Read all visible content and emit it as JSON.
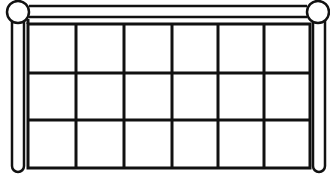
{
  "figure": {
    "stroke_color": "#111111",
    "background": "#ffffff",
    "grid": {
      "columns": 6,
      "rows": 3,
      "x_lines": [
        28,
        76,
        124,
        172,
        218,
        264,
        310
      ],
      "y_lines": [
        24,
        73,
        120,
        168
      ]
    },
    "posts": [
      {
        "side": "left",
        "x": 12,
        "width": 12,
        "top": 20,
        "bottom": 172
      },
      {
        "side": "right",
        "x": 313,
        "width": 12,
        "top": 20,
        "bottom": 172
      }
    ],
    "finials": [
      {
        "side": "left",
        "cx": 18,
        "cy": 12,
        "r": 11
      },
      {
        "side": "right",
        "cx": 318,
        "cy": 12,
        "r": 11
      }
    ],
    "top_rail": {
      "y_top": 6,
      "y_bottom": 17,
      "x_start": 29,
      "x_end": 307
    }
  }
}
